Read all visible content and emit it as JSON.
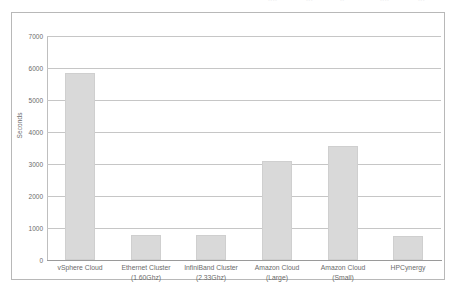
{
  "top_fragments": [
    {
      "text": "....",
      "left": 268
    },
    {
      "text": "...",
      "left": 306
    },
    {
      "text": "..",
      "left": 340
    },
    {
      "text": "....",
      "left": 380
    },
    {
      "text": "...",
      "left": 418
    }
  ],
  "chart_data": {
    "type": "bar",
    "title": "",
    "xlabel": "",
    "ylabel": "Seconds",
    "ylim": [
      0,
      7000
    ],
    "ytick_step": 1000,
    "yticks": [
      0,
      1000,
      2000,
      3000,
      4000,
      5000,
      6000,
      7000
    ],
    "ytick_labels": [
      "0",
      "1000",
      "2000",
      "3000",
      "4000",
      "5000",
      "6000",
      "7000"
    ],
    "grid": "horizontal",
    "legend": "none",
    "bar_color": "#d9d9d9",
    "bar_edge_color": "#cfcfcf",
    "gridline_color": "#c6c6c6",
    "categories": [
      {
        "line1": "vSphere Cloud",
        "line2": ""
      },
      {
        "line1": "Ethernet Cluster",
        "line2": "(1.60Ghz)"
      },
      {
        "line1": "InfiniBand Cluster",
        "line2": "(2.33Ghz)"
      },
      {
        "line1": "Amazon Cloud",
        "line2": "(Large)"
      },
      {
        "line1": "Amazon Cloud",
        "line2": "(Small)"
      },
      {
        "line1": "HPCynergy",
        "line2": ""
      }
    ],
    "values": [
      5850,
      780,
      780,
      3100,
      3550,
      750
    ]
  }
}
